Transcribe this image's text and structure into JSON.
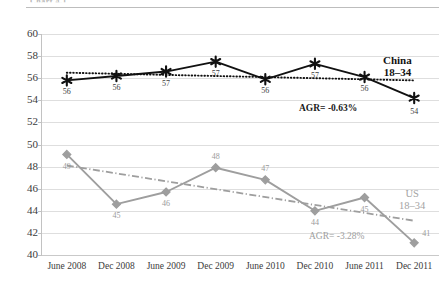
{
  "header": {
    "ghost_text": "Chart 4.1"
  },
  "chart_data": {
    "type": "line",
    "title": "",
    "xlabel": "",
    "ylabel": "",
    "ylim": [
      40,
      60
    ],
    "ytick_step": 2,
    "grid": true,
    "legend_position": "right-inline",
    "categories": [
      "June 2008",
      "Dec 2008",
      "June 2009",
      "Dec 2009",
      "June 2010",
      "Dec 2010",
      "June 2011",
      "Dec 2011"
    ],
    "yticks": [
      "40",
      "42",
      "44",
      "46",
      "48",
      "50",
      "52",
      "54",
      "56",
      "58",
      "60"
    ],
    "series": [
      {
        "name": "China 18-34",
        "legend_line1": "China",
        "legend_line2": "18–34",
        "color": "#111111",
        "marker": "star",
        "values": [
          55.8,
          56.2,
          56.6,
          57.5,
          55.9,
          57.3,
          56.1,
          54.2
        ],
        "labels": [
          "56",
          "56",
          "57",
          "57",
          "56",
          "57",
          "56",
          "54"
        ],
        "trendline": {
          "type": "dotted",
          "start": 56.5,
          "end": 55.8
        },
        "annotation": "AGR= -0.63%"
      },
      {
        "name": "US 18-34",
        "legend_line1": "US",
        "legend_line2": "18–34",
        "color": "#9e9e9e",
        "marker": "diamond",
        "values": [
          49.1,
          44.6,
          45.7,
          47.9,
          46.8,
          44.0,
          45.2,
          41.1
        ],
        "labels": [
          "49",
          "45",
          "46",
          "48",
          "47",
          "44",
          "45",
          "41"
        ],
        "trendline": {
          "type": "dash-dot",
          "start": 48.1,
          "end": 43.1
        },
        "annotation": "AGR= -3.28%"
      }
    ]
  }
}
